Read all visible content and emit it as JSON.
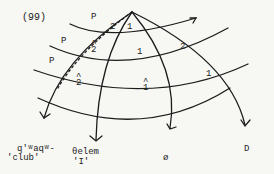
{
  "example_number": "(99)",
  "p_labels": [
    "P",
    "P",
    "P"
  ],
  "region_labels": {
    "top_left_2": "2",
    "top_right_1": "1",
    "band1_hat2": "2",
    "band1_center_1": "1",
    "band1_right_2": "2",
    "band2_hat2": "2",
    "band2_hat1": "1",
    "band2_right_1": "1"
  },
  "hat_glyph": "^",
  "bottom_labels": [
    {
      "line1": "q'ʷaqʷ-",
      "line2": "'club'"
    },
    {
      "line1": "θelem",
      "line2": "'I'"
    },
    {
      "line1": "ø",
      "line2": ""
    },
    {
      "line1": "D",
      "line2": ""
    }
  ]
}
